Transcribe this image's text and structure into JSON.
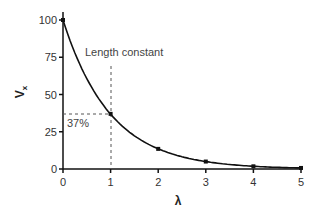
{
  "chart_data": {
    "type": "line",
    "title": "",
    "xlabel": "λ",
    "ylabel": "Vx",
    "xlim": [
      0,
      5
    ],
    "ylim": [
      0,
      100
    ],
    "x_ticks": [
      "0",
      "1",
      "2",
      "3",
      "4",
      "5"
    ],
    "y_ticks": [
      "0",
      "25",
      "50",
      "75",
      "100"
    ],
    "grid": false,
    "series": [
      {
        "name": "exp(-λ)",
        "x": [
          0,
          1,
          2,
          3,
          4,
          5
        ],
        "y": [
          100,
          37,
          13.5,
          5,
          1.8,
          0.7
        ]
      }
    ],
    "annotations": [
      {
        "text": "Length constant",
        "x": 1
      },
      {
        "text": "37%",
        "y": 37
      }
    ]
  },
  "labels": {
    "xlabel": "λ",
    "ylabel_main": "V",
    "ylabel_sub": "x",
    "length_constant": "Length constant",
    "pct": "37%"
  },
  "colors": {
    "curve": "#111111",
    "dashed": "#555555"
  }
}
